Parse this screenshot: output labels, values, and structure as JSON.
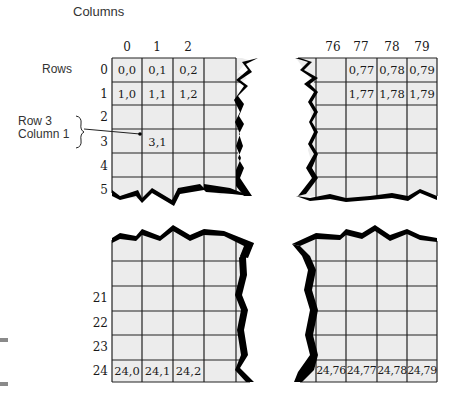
{
  "diagram": {
    "title": "Columns",
    "rows_label": "Rows",
    "annotation": {
      "line1": "Row 3",
      "line2": "Column 1",
      "target_cell": "3,1"
    },
    "column_headers_left": [
      "0",
      "1",
      "2"
    ],
    "column_headers_right": [
      "76",
      "77",
      "78",
      "79"
    ],
    "row_headers_top": [
      "0",
      "1",
      "2",
      "3",
      "4",
      "5"
    ],
    "row_headers_bottom": [
      "21",
      "22",
      "23",
      "24"
    ],
    "cells_top_left": {
      "r0": [
        "0,0",
        "0,1",
        "0,2"
      ],
      "r1": [
        "1,0",
        "1,1",
        "1,2"
      ],
      "r3c1": "3,1"
    },
    "cells_top_right": {
      "r0": [
        "0,77",
        "0,78",
        "0,79"
      ],
      "r1": [
        "1,77",
        "1,78",
        "1,79"
      ]
    },
    "cells_bottom_left": {
      "r24": [
        "24,0",
        "24,1",
        "24,2"
      ]
    },
    "cells_bottom_right": {
      "r24": [
        "24,76",
        "24,77",
        "24,78",
        "24,79"
      ]
    },
    "colors": {
      "cell_fill": "#ececec",
      "grid_line": "#222222",
      "tear_edge": "#000000"
    }
  }
}
